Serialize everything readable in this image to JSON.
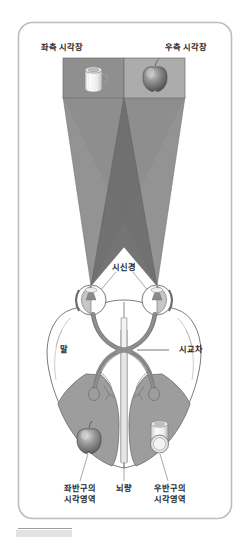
{
  "figure": {
    "frame": {
      "border_color": "#b9b9b9",
      "background_color": "#ffffff",
      "corner_radius": 14
    },
    "palette": {
      "panel_left": "#8e8e8e",
      "panel_right": "#a9a9a9",
      "cone_light": "#b5b5b5",
      "cone_dark": "#8a8a8a",
      "cone_overlap": "#6f6f6f",
      "brain_fill": "#ffffff",
      "brain_outline": "#6b6b6b",
      "cortex_fill": "#9d9d9d",
      "nerve_fill": "#a0a0a0",
      "text": "#25272a",
      "footer_bar": "#d4d4d4"
    },
    "labels": {
      "left_visual_field": "좌측 시각장",
      "right_visual_field": "우측 시각장",
      "optic_nerve": "시신경",
      "eye": "말",
      "optic_chiasm": "시교차",
      "left_hemisphere_visual_area": "좌반구의\n시각영역",
      "corpus_callosum": "뇌량",
      "right_hemisphere_visual_area": "우반구의\n시각영역"
    },
    "objects": {
      "cup": "cup-object",
      "apple": "apple-object",
      "cup_in_cortex": "cup-projection",
      "apple_in_cortex": "apple-projection"
    }
  }
}
